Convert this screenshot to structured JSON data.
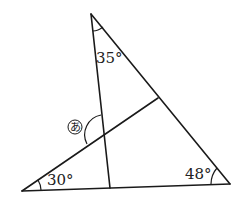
{
  "figure": {
    "type": "geometry-triangle",
    "angles": {
      "top": "35°",
      "bottom_left": "30°",
      "bottom_right": "48°",
      "unknown": "あ"
    },
    "colors": {
      "line": "#1a1a1a",
      "background": "#ffffff"
    }
  }
}
